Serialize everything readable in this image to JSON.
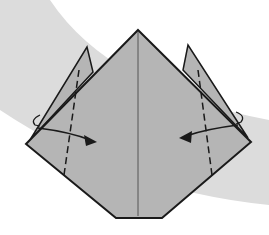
{
  "diagram": {
    "type": "origami-fold-step",
    "colors": {
      "background": "#ffffff",
      "swoosh": "#d9d9d9",
      "paper": "#b5b5b5",
      "line": "#1a1a1a"
    },
    "elements": [
      "top point",
      "left flap",
      "right flap",
      "center crease",
      "left valley fold (dashed)",
      "right valley fold (dashed)",
      "left arrow inward",
      "right arrow inward"
    ]
  }
}
